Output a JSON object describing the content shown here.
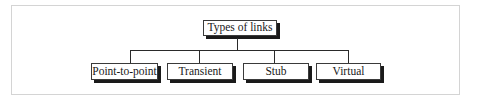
{
  "diagram": {
    "type": "tree",
    "root": {
      "label": "Types of links"
    },
    "children": [
      {
        "label": "Point-to-point"
      },
      {
        "label": "Transient"
      },
      {
        "label": "Stub"
      },
      {
        "label": "Virtual"
      }
    ]
  },
  "colors": {
    "frame_border": "#d4d4d4",
    "node_border": "#3a3a3a",
    "node_shadow": "#1a1a1a",
    "connector": "#2a2a2a",
    "background": "#ffffff"
  }
}
